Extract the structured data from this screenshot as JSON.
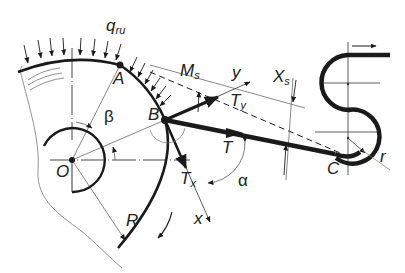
{
  "diagram": {
    "type": "mechanical free-body diagram (belt/tape wrapping around a drum and over rollers)",
    "colors": {
      "ink": "#1a1a1a",
      "thin": "#555555",
      "background": "#ffffff"
    },
    "labels": {
      "q_main": "q",
      "q_sub": "ru",
      "A": "A",
      "Ms_main": "M",
      "Ms_sub": "s",
      "y": "y",
      "Xs_main": "X",
      "Xs_sub": "s",
      "Ty_main": "T",
      "Ty_sub": "y",
      "B": "B",
      "beta": "β",
      "T": "T",
      "O": "O",
      "Tx_main": "T",
      "Tx_sub": "x",
      "alpha": "α",
      "R": "R",
      "x": "x",
      "C": "C",
      "r": "r"
    },
    "elements": [
      "distributed-load arrows q_ru on drum arc",
      "drum arc radius R centered at O",
      "hub circle at O",
      "point A on drum",
      "point B tangent departure",
      "tension T along belt B to C",
      "components T_x and T_y at B",
      "local axes x and y at B",
      "moment M_s and offset X_s",
      "angles alpha and beta",
      "two rollers forming figure-8 with radius r",
      "output direction arrow at top right"
    ]
  }
}
